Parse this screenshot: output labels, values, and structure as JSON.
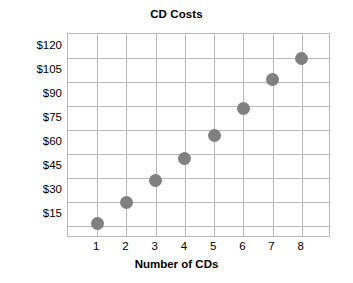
{
  "chart_data": {
    "type": "scatter",
    "title": "CD Costs",
    "xlabel": "Number of CDs",
    "ylabel": "",
    "x": [
      1,
      2,
      3,
      4,
      5,
      6,
      7,
      8
    ],
    "values": [
      9,
      22,
      36,
      50,
      64,
      81,
      99,
      112
    ],
    "xtick_labels": [
      "1",
      "2",
      "3",
      "4",
      "5",
      "6",
      "7",
      "8"
    ],
    "ytick_labels": [
      "$120",
      "$105",
      "$90",
      "$75",
      "$60",
      "$45",
      "$30",
      "$15"
    ],
    "ytick_values": [
      120,
      105,
      90,
      75,
      60,
      45,
      30,
      15
    ],
    "xlim": [
      0,
      9
    ],
    "ylim": [
      0,
      127.5
    ],
    "grid": true,
    "legend": false,
    "point_color": "#808080",
    "grid_color": "#b9b9b9",
    "axis_color": "#b9b9b9",
    "background": "#ffffff",
    "text_color": "#000000"
  }
}
